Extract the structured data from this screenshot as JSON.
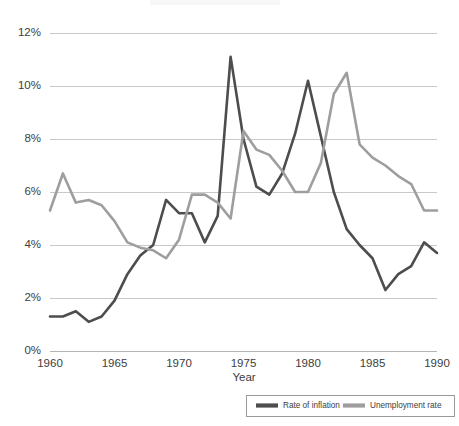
{
  "chart_data": {
    "type": "line",
    "title": "",
    "xlabel": "Year",
    "ylabel": "",
    "xlim": [
      1960,
      1990
    ],
    "ylim": [
      0,
      12
    ],
    "grid": true,
    "legend_position": "bottom-right",
    "x": [
      1960,
      1961,
      1962,
      1963,
      1964,
      1965,
      1966,
      1967,
      1968,
      1969,
      1970,
      1971,
      1972,
      1973,
      1974,
      1975,
      1976,
      1977,
      1978,
      1979,
      1980,
      1981,
      1982,
      1983,
      1984,
      1985,
      1986,
      1987,
      1988,
      1989,
      1990
    ],
    "xtick_labels": [
      "1960",
      "1965",
      "1970",
      "1975",
      "1980",
      "1985",
      "1990"
    ],
    "xticks": [
      1960,
      1965,
      1970,
      1975,
      1980,
      1985,
      1990
    ],
    "ytick_labels": [
      "0%",
      "2%",
      "4%",
      "6%",
      "8%",
      "10%",
      "12%"
    ],
    "yticks": [
      0,
      2,
      4,
      6,
      8,
      10,
      12
    ],
    "series": [
      {
        "name": "Rate of inflation",
        "color": "#4d4d4d",
        "values": [
          1.3,
          1.3,
          1.5,
          1.1,
          1.3,
          1.9,
          2.9,
          3.6,
          4.0,
          5.7,
          5.2,
          5.2,
          4.1,
          5.1,
          11.1,
          8.0,
          6.2,
          5.9,
          6.7,
          8.2,
          10.2,
          8.1,
          6.0,
          4.6,
          4.0,
          3.5,
          2.3,
          2.9,
          3.2,
          4.1,
          3.7
        ]
      },
      {
        "name": "Unemployment rate",
        "color": "#9e9e9e",
        "values": [
          5.3,
          6.7,
          5.6,
          5.7,
          5.5,
          4.9,
          4.1,
          3.9,
          3.8,
          3.5,
          4.2,
          5.9,
          5.9,
          5.6,
          5.0,
          8.3,
          7.6,
          7.4,
          6.8,
          6.0,
          6.0,
          7.1,
          9.7,
          10.5,
          7.8,
          7.3,
          7.0,
          6.6,
          6.3,
          5.3,
          5.3
        ]
      }
    ],
    "legend": [
      {
        "label": "Rate of inflation",
        "color": "#4d4d4d"
      },
      {
        "label": "Unemployment rate",
        "color": "#9e9e9e"
      }
    ],
    "colors": {
      "inflation": "#4d4d4d",
      "unemployment": "#9e9e9e",
      "gridline": "#c9c9c9",
      "text": "#3d3d3d",
      "background": "#ffffff"
    }
  }
}
